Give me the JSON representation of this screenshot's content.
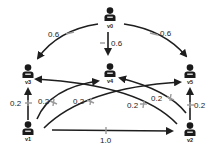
{
  "diagram": {
    "type": "directed weighted graph",
    "colors": {
      "edge": "#1e1e1e",
      "node": "#1a1a1a",
      "tick": "#9a9a9a",
      "background": "#ffffff"
    },
    "nodes": [
      {
        "id": "v0",
        "label": "v0",
        "icon": "user-icon"
      },
      {
        "id": "v1",
        "label": "v1",
        "icon": "user-icon"
      },
      {
        "id": "v2",
        "label": "v2",
        "icon": "user-icon"
      },
      {
        "id": "v3",
        "label": "v3",
        "icon": "user-icon"
      },
      {
        "id": "v4",
        "label": "v4",
        "icon": "user-icon"
      },
      {
        "id": "v5",
        "label": "v5",
        "icon": "user-icon"
      }
    ],
    "edges": [
      {
        "from": "v0",
        "to": "v3",
        "weight": "0.6"
      },
      {
        "from": "v0",
        "to": "v4",
        "weight": "0.6"
      },
      {
        "from": "v0",
        "to": "v5",
        "weight": "0.6"
      },
      {
        "from": "v1",
        "to": "v3",
        "weight": "0.2"
      },
      {
        "from": "v1",
        "to": "v4",
        "weight": "0.2"
      },
      {
        "from": "v1",
        "to": "v5",
        "weight": "0.2"
      },
      {
        "from": "v1",
        "to": "v2",
        "weight": "1.0"
      },
      {
        "from": "v2",
        "to": "v3",
        "weight": "0.2"
      },
      {
        "from": "v2",
        "to": "v4",
        "weight": "0.2"
      },
      {
        "from": "v2",
        "to": "v5",
        "weight": "0.2"
      }
    ]
  }
}
